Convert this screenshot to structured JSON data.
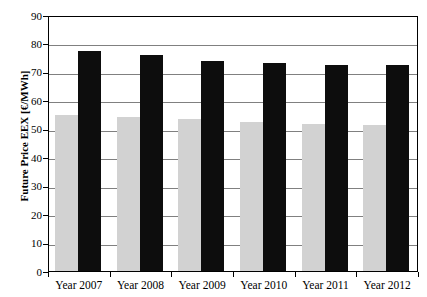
{
  "chart_data": {
    "type": "bar",
    "title": "",
    "subtitle": "",
    "xlabel": "",
    "ylabel": "Future Price EEX [€/MWh]",
    "categories": [
      "Year 2007",
      "Year 2008",
      "Year 2009",
      "Year 2010",
      "Year 2011",
      "Year 2012"
    ],
    "series": [
      {
        "name": "light-gray-series",
        "color": "#d2d2d2",
        "values": [
          55,
          54,
          53.5,
          52.5,
          51.7,
          51.3
        ]
      },
      {
        "name": "black-series",
        "color": "#0d0d0d",
        "values": [
          77.3,
          76,
          73.7,
          73,
          72.5,
          72.3
        ]
      }
    ],
    "ylim": [
      0,
      90
    ],
    "yticks": [
      0,
      10,
      20,
      30,
      40,
      50,
      60,
      70,
      80,
      90
    ],
    "ytick_labels": [
      "0",
      "10",
      "20",
      "30",
      "40",
      "50",
      "60",
      "70",
      "80",
      "90"
    ],
    "grid": true,
    "grid_axis": "y",
    "legend": "none",
    "legend_position": "none",
    "bar_gap_group": true
  },
  "axes": {
    "y_title": "Future Price EEX [€/MWh]",
    "y_tick_values": [
      "0",
      "10",
      "20",
      "30",
      "40",
      "50",
      "60",
      "70",
      "80",
      "90"
    ],
    "x_tick_labels": [
      "Year 2007",
      "Year 2008",
      "Year 2009",
      "Year 2010",
      "Year 2011",
      "Year 2012"
    ]
  },
  "colors": {
    "series_light": "#d2d2d2",
    "series_dark": "#0d0d0d",
    "gridline": "#808080",
    "axis": "#000000",
    "background": "#ffffff"
  }
}
